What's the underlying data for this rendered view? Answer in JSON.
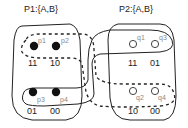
{
  "diagram": {
    "left_box": {
      "title": "P1:{A,B}",
      "points": [
        {
          "id": "p1",
          "label": "p1",
          "code": "11",
          "filled": true
        },
        {
          "id": "p2",
          "label": "p2",
          "code": "10",
          "filled": true
        },
        {
          "id": "p3",
          "label": "p3",
          "code": "01",
          "filled": true
        },
        {
          "id": "p4",
          "label": "p4",
          "code": "00",
          "filled": true
        }
      ]
    },
    "right_box": {
      "title": "P2:{A,B}",
      "points": [
        {
          "id": "q1",
          "label": "q1",
          "code": "11",
          "filled": false
        },
        {
          "id": "q3",
          "label": "q3",
          "code": "01",
          "filled": false
        },
        {
          "id": "q2",
          "label": "q2",
          "code": "10",
          "filled": false
        },
        {
          "id": "q4",
          "label": "q4",
          "code": "00",
          "filled": false
        }
      ]
    },
    "groupings": [
      {
        "name": "dashed-group-p1-p2-q2-q4",
        "style": "dashed"
      },
      {
        "name": "solid-group-p3-p4-q1-q3",
        "style": "solid"
      }
    ],
    "colors": {
      "stroke": "#222222",
      "label_gray": "#888888",
      "fill": "#111111"
    }
  }
}
